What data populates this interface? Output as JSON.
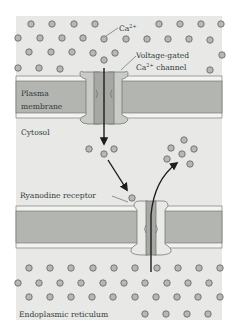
{
  "diagram": {
    "labels": {
      "ion": "Ca",
      "ion_charge": "2+",
      "voltage_channel_line1": "Voltage-gated",
      "voltage_channel_line2_prefix": "Ca",
      "voltage_channel_line2_charge": "2+",
      "voltage_channel_line2_suffix": " channel",
      "plasma_membrane_line1": "Plasma",
      "plasma_membrane_line2": "membrane",
      "cytosol": "Cytosol",
      "ryanodine_receptor": "Ryanodine receptor",
      "er": "Endoplasmic reticulum"
    },
    "colors": {
      "background": "#e8e9e6",
      "membrane_core": "#b3b5b1",
      "membrane_edge": "#f3f4f2",
      "channel_outer": "#c9cbc7",
      "channel_inner": "#a6a8a4",
      "ryr_outer": "#e9eae7",
      "ion_fill": "#b6b8b4",
      "ion_stroke": "#6a6d69",
      "arrow": "#1d1d1d",
      "text": "#2f3b3a"
    }
  }
}
